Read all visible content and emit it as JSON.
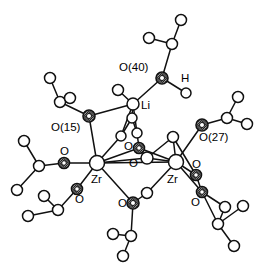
{
  "figure": {
    "kind": "molecular-structure-diagram",
    "caption": "",
    "background_color": "#ffffff",
    "line_color": "#111111",
    "width": 268,
    "height": 270
  },
  "chart_data": {
    "type": "diagram",
    "title": "",
    "subtitle": "",
    "xlabel": "",
    "ylabel": "",
    "legend": [],
    "atoms": [
      {
        "id": "zr1",
        "element": "Zr",
        "label": "Zr",
        "style": "open",
        "r": 7.5,
        "x": 97,
        "y": 163
      },
      {
        "id": "zr2",
        "element": "Zr",
        "label": "Zr",
        "style": "open",
        "r": 7.5,
        "x": 176,
        "y": 162
      },
      {
        "id": "li1",
        "element": "Li",
        "label": "Li",
        "style": "open",
        "r": 6.0,
        "x": 133,
        "y": 104
      },
      {
        "id": "o40",
        "element": "O",
        "label": "O(40)",
        "style": "shaded",
        "r": 6.0,
        "x": 162,
        "y": 78
      },
      {
        "id": "o15",
        "element": "O",
        "label": "O(15)",
        "style": "shaded",
        "r": 6.0,
        "x": 89,
        "y": 116
      },
      {
        "id": "o27",
        "element": "O",
        "label": "O(27)",
        "style": "shaded",
        "r": 6.0,
        "x": 202,
        "y": 125
      },
      {
        "id": "oc1",
        "element": "O",
        "label": "O",
        "style": "shaded",
        "r": 5.5,
        "x": 139,
        "y": 148
      },
      {
        "id": "oc2",
        "element": "O",
        "label": "O",
        "style": "open",
        "r": 6.0,
        "x": 147,
        "y": 158
      },
      {
        "id": "ob",
        "element": "O",
        "label": "O",
        "style": "shaded",
        "r": 6.0,
        "x": 133,
        "y": 203
      },
      {
        "id": "obr",
        "element": "O",
        "label": "",
        "style": "open",
        "r": 5.5,
        "x": 147,
        "y": 193
      },
      {
        "id": "ol",
        "element": "O",
        "label": "O",
        "style": "shaded",
        "r": 5.5,
        "x": 64,
        "y": 163
      },
      {
        "id": "olb",
        "element": "O",
        "label": "O",
        "style": "shaded",
        "r": 5.5,
        "x": 77,
        "y": 189
      },
      {
        "id": "orb1",
        "element": "O",
        "label": "O",
        "style": "shaded",
        "r": 5.5,
        "x": 196,
        "y": 175
      },
      {
        "id": "orb2",
        "element": "O",
        "label": "O",
        "style": "shaded",
        "r": 5.5,
        "x": 202,
        "y": 192
      },
      {
        "id": "h1",
        "element": "H",
        "label": "H",
        "style": "none",
        "r": 0,
        "x": 184,
        "y": 79
      },
      {
        "id": "hw",
        "element": "O",
        "label": "",
        "style": "open",
        "r": 5.0,
        "x": 186,
        "y": 93
      },
      {
        "id": "c40",
        "element": "C",
        "label": "",
        "style": "open",
        "r": 5.5,
        "x": 172,
        "y": 44
      },
      {
        "id": "m40a",
        "element": "C",
        "label": "",
        "style": "open",
        "r": 5.5,
        "x": 181,
        "y": 20
      },
      {
        "id": "m40b",
        "element": "C",
        "label": "",
        "style": "open",
        "r": 5.5,
        "x": 149,
        "y": 38
      },
      {
        "id": "c15",
        "element": "C",
        "label": "",
        "style": "open",
        "r": 5.5,
        "x": 60,
        "y": 102
      },
      {
        "id": "m15a",
        "element": "C",
        "label": "",
        "style": "open",
        "r": 5.5,
        "x": 50,
        "y": 78
      },
      {
        "id": "m15b",
        "element": "C",
        "label": "",
        "style": "open",
        "r": 5.5,
        "x": 70,
        "y": 98
      },
      {
        "id": "c27",
        "element": "C",
        "label": "",
        "style": "open",
        "r": 5.5,
        "x": 227,
        "y": 118
      },
      {
        "id": "m27a",
        "element": "C",
        "label": "",
        "style": "open",
        "r": 5.5,
        "x": 238,
        "y": 97
      },
      {
        "id": "m27b",
        "element": "C",
        "label": "",
        "style": "open",
        "r": 5.5,
        "x": 247,
        "y": 124
      },
      {
        "id": "cl",
        "element": "C",
        "label": "",
        "style": "open",
        "r": 5.5,
        "x": 39,
        "y": 166
      },
      {
        "id": "mla",
        "element": "C",
        "label": "",
        "style": "open",
        "r": 5.5,
        "x": 24,
        "y": 141
      },
      {
        "id": "mlb",
        "element": "C",
        "label": "",
        "style": "open",
        "r": 5.5,
        "x": 17,
        "y": 190
      },
      {
        "id": "clb",
        "element": "C",
        "label": "",
        "style": "open",
        "r": 5.5,
        "x": 58,
        "y": 210
      },
      {
        "id": "mlba",
        "element": "C",
        "label": "",
        "style": "open",
        "r": 5.5,
        "x": 44,
        "y": 196
      },
      {
        "id": "mlbb",
        "element": "C",
        "label": "",
        "style": "open",
        "r": 5.5,
        "x": 28,
        "y": 216
      },
      {
        "id": "cb",
        "element": "C",
        "label": "",
        "style": "open",
        "r": 5.5,
        "x": 131,
        "y": 236
      },
      {
        "id": "mba",
        "element": "C",
        "label": "",
        "style": "open",
        "r": 5.5,
        "x": 113,
        "y": 234
      },
      {
        "id": "mbb",
        "element": "C",
        "label": "",
        "style": "open",
        "r": 5.5,
        "x": 123,
        "y": 256
      },
      {
        "id": "crb",
        "element": "C",
        "label": "",
        "style": "open",
        "r": 5.5,
        "x": 218,
        "y": 224
      },
      {
        "id": "mrba",
        "element": "C",
        "label": "",
        "style": "open",
        "r": 5.5,
        "x": 225,
        "y": 207
      },
      {
        "id": "mrbb",
        "element": "C",
        "label": "",
        "style": "open",
        "r": 5.5,
        "x": 243,
        "y": 206
      },
      {
        "id": "mrbc",
        "element": "C",
        "label": "",
        "style": "open",
        "r": 5.5,
        "x": 234,
        "y": 246
      },
      {
        "id": "tl1",
        "element": "C",
        "label": "",
        "style": "open",
        "r": 5.5,
        "x": 118,
        "y": 90
      },
      {
        "id": "ct1",
        "element": "C",
        "label": "",
        "style": "open",
        "r": 5.0,
        "x": 132,
        "y": 118
      },
      {
        "id": "ct2",
        "element": "C",
        "label": "",
        "style": "open",
        "r": 5.0,
        "x": 121,
        "y": 136
      },
      {
        "id": "ct3",
        "element": "C",
        "label": "",
        "style": "open",
        "r": 5.0,
        "x": 137,
        "y": 133
      },
      {
        "id": "cr1",
        "element": "C",
        "label": "",
        "style": "open",
        "r": 5.5,
        "x": 173,
        "y": 137
      }
    ],
    "bonds": [
      {
        "from": "zr1",
        "to": "zr2",
        "kind": "solid"
      },
      {
        "from": "zr1",
        "to": "o15",
        "kind": "solid"
      },
      {
        "from": "zr1",
        "to": "ol",
        "kind": "solid"
      },
      {
        "from": "zr1",
        "to": "olb",
        "kind": "solid"
      },
      {
        "from": "zr1",
        "to": "ob",
        "kind": "solid"
      },
      {
        "from": "zr1",
        "to": "oc2",
        "kind": "solid"
      },
      {
        "from": "zr1",
        "to": "oc1",
        "kind": "solid"
      },
      {
        "from": "zr2",
        "to": "o27",
        "kind": "solid"
      },
      {
        "from": "zr2",
        "to": "orb1",
        "kind": "solid"
      },
      {
        "from": "zr2",
        "to": "orb2",
        "kind": "solid"
      },
      {
        "from": "zr2",
        "to": "obr",
        "kind": "solid"
      },
      {
        "from": "zr2",
        "to": "oc2",
        "kind": "solid"
      },
      {
        "from": "zr2",
        "to": "oc1",
        "kind": "solid"
      },
      {
        "from": "zr2",
        "to": "cr1",
        "kind": "solid"
      },
      {
        "from": "obr",
        "to": "ob",
        "kind": "solid"
      },
      {
        "from": "ob",
        "to": "cb",
        "kind": "solid"
      },
      {
        "from": "cb",
        "to": "mba",
        "kind": "solid"
      },
      {
        "from": "cb",
        "to": "mbb",
        "kind": "solid"
      },
      {
        "from": "li1",
        "to": "o40",
        "kind": "solid"
      },
      {
        "from": "li1",
        "to": "o15",
        "kind": "solid"
      },
      {
        "from": "li1",
        "to": "tl1",
        "kind": "solid"
      },
      {
        "from": "li1",
        "to": "ct1",
        "kind": "solid"
      },
      {
        "from": "li1",
        "to": "ct2",
        "kind": "solid"
      },
      {
        "from": "li1",
        "to": "ct3",
        "kind": "solid"
      },
      {
        "from": "ct1",
        "to": "ct2",
        "kind": "solid"
      },
      {
        "from": "ct1",
        "to": "ct3",
        "kind": "solid"
      },
      {
        "from": "ct2",
        "to": "zr1",
        "kind": "solid"
      },
      {
        "from": "ct3",
        "to": "oc1",
        "kind": "solid"
      },
      {
        "from": "oc1",
        "to": "oc2",
        "kind": "solid"
      },
      {
        "from": "oc2",
        "to": "cr1",
        "kind": "solid"
      },
      {
        "from": "o40",
        "to": "c40",
        "kind": "solid"
      },
      {
        "from": "o40",
        "to": "hw",
        "kind": "solid"
      },
      {
        "from": "c40",
        "to": "m40a",
        "kind": "solid"
      },
      {
        "from": "c40",
        "to": "m40b",
        "kind": "solid"
      },
      {
        "from": "o15",
        "to": "c15",
        "kind": "solid"
      },
      {
        "from": "c15",
        "to": "m15a",
        "kind": "solid"
      },
      {
        "from": "c15",
        "to": "m15b",
        "kind": "solid"
      },
      {
        "from": "o27",
        "to": "c27",
        "kind": "solid"
      },
      {
        "from": "c27",
        "to": "m27a",
        "kind": "solid"
      },
      {
        "from": "c27",
        "to": "m27b",
        "kind": "solid"
      },
      {
        "from": "ol",
        "to": "cl",
        "kind": "solid"
      },
      {
        "from": "cl",
        "to": "mla",
        "kind": "solid"
      },
      {
        "from": "cl",
        "to": "mlb",
        "kind": "solid"
      },
      {
        "from": "olb",
        "to": "clb",
        "kind": "solid"
      },
      {
        "from": "clb",
        "to": "mlba",
        "kind": "solid"
      },
      {
        "from": "clb",
        "to": "mlbb",
        "kind": "solid"
      },
      {
        "from": "orb1",
        "to": "orb2",
        "kind": "solid"
      },
      {
        "from": "orb1",
        "to": "cr1",
        "kind": "solid"
      },
      {
        "from": "orb2",
        "to": "crb",
        "kind": "solid"
      },
      {
        "from": "orb2",
        "to": "mrba",
        "kind": "solid"
      },
      {
        "from": "crb",
        "to": "mrba",
        "kind": "solid"
      },
      {
        "from": "crb",
        "to": "mrbb",
        "kind": "solid"
      },
      {
        "from": "crb",
        "to": "mrbc",
        "kind": "solid"
      }
    ],
    "labels": [
      {
        "id": "lbl-o40",
        "text": "O(40)",
        "x": 119,
        "y": 68,
        "anchor": "start",
        "size": 11.5
      },
      {
        "id": "lbl-h",
        "text": "H",
        "x": 181,
        "y": 79,
        "anchor": "start",
        "size": 11.5
      },
      {
        "id": "lbl-li",
        "text": "Li",
        "x": 141,
        "y": 106,
        "anchor": "start",
        "size": 11.5
      },
      {
        "id": "lbl-o15",
        "text": "O(15)",
        "x": 51,
        "y": 128,
        "anchor": "start",
        "size": 11.5
      },
      {
        "id": "lbl-o27",
        "text": "O(27)",
        "x": 199,
        "y": 138,
        "anchor": "start",
        "size": 11.5
      },
      {
        "id": "lbl-oc1",
        "text": "O",
        "x": 124,
        "y": 147,
        "anchor": "start",
        "size": 11.5
      },
      {
        "id": "lbl-oc2",
        "text": "O",
        "x": 129,
        "y": 164,
        "anchor": "start",
        "size": 11.5
      },
      {
        "id": "lbl-zr1",
        "text": "Zr",
        "x": 91,
        "y": 180,
        "anchor": "start",
        "size": 11.5
      },
      {
        "id": "lbl-zr2",
        "text": "Zr",
        "x": 167,
        "y": 180,
        "anchor": "start",
        "size": 11.5
      },
      {
        "id": "lbl-ol",
        "text": "O",
        "x": 60,
        "y": 152,
        "anchor": "start",
        "size": 11.5
      },
      {
        "id": "lbl-olb",
        "text": "O",
        "x": 75,
        "y": 200,
        "anchor": "start",
        "size": 11.5
      },
      {
        "id": "lbl-ob",
        "text": "O",
        "x": 118,
        "y": 204,
        "anchor": "start",
        "size": 11.5
      },
      {
        "id": "lbl-orb1",
        "text": "O",
        "x": 192,
        "y": 165,
        "anchor": "start",
        "size": 11.5
      },
      {
        "id": "lbl-orb2",
        "text": "O",
        "x": 191,
        "y": 203,
        "anchor": "start",
        "size": 11.5
      }
    ]
  }
}
